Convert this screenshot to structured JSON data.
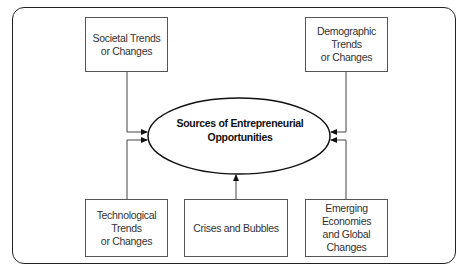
{
  "diagram": {
    "center": {
      "label": "Sources of Entrepreneurial\nOpportunities"
    },
    "sources": [
      {
        "id": "societal",
        "label": "Societal Trends\nor Changes"
      },
      {
        "id": "demographic",
        "label": "Demographic Trends\nor Changes"
      },
      {
        "id": "technological",
        "label": "Technological Trends\nor Changes"
      },
      {
        "id": "crises",
        "label": "Crises and Bubbles"
      },
      {
        "id": "emerging",
        "label": "Emerging Economies\nand Global Changes"
      }
    ],
    "colors": {
      "border": "#222222",
      "box_border": "#555555",
      "text": "#333333",
      "background": "#ffffff"
    }
  }
}
